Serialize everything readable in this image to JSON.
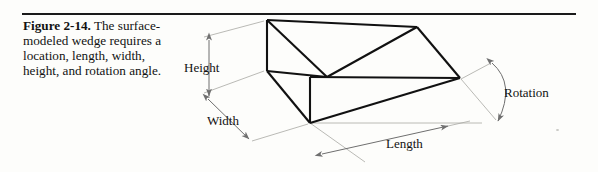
{
  "figure": {
    "number": "Figure 2-14.",
    "caption": "The surface-modeled wedge requires a location, length, width, height, and rotation angle."
  },
  "diagram": {
    "title": "surface-modeled wedge",
    "labels": {
      "height": "Height",
      "width": "Width",
      "length": "Length",
      "rotation": "Rotation"
    },
    "colors": {
      "solid_edge": "#1a1a1a",
      "dimension_line": "#8d8d8d",
      "rule": "#1a1a1a",
      "text": "#121212"
    },
    "wedge_vertices": {
      "back_top_left": [
        267,
        20
      ],
      "back_bottom_left": [
        267,
        70
      ],
      "front_bottom_left": [
        310,
        123
      ],
      "back_top_right": [
        417,
        27
      ],
      "mid_right": [
        460,
        78
      ],
      "ridge_mid": [
        327,
        77
      ]
    }
  }
}
